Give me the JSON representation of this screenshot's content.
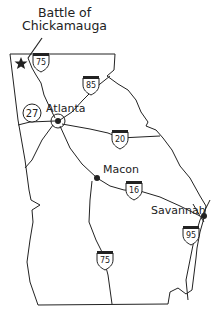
{
  "map": {
    "title_line1": "Battle of",
    "title_line2": "Chickamauga",
    "colors": {
      "ink": "#222222",
      "background": "#ffffff"
    },
    "cities": [
      {
        "name": "Atlanta",
        "x": 57,
        "y": 121
      },
      {
        "name": "Macon",
        "x": 97,
        "y": 178
      },
      {
        "name": "Savannah",
        "x": 204,
        "y": 216
      }
    ],
    "highways": [
      {
        "type": "interstate",
        "number": "75",
        "x": 41,
        "y": 55
      },
      {
        "type": "interstate",
        "number": "85",
        "x": 91,
        "y": 78
      },
      {
        "type": "interstate",
        "number": "20",
        "x": 120,
        "y": 134
      },
      {
        "type": "interstate",
        "number": "16",
        "x": 134,
        "y": 187
      },
      {
        "type": "interstate",
        "number": "95",
        "x": 190,
        "y": 233
      },
      {
        "type": "interstate",
        "number": "75",
        "x": 105,
        "y": 260
      },
      {
        "type": "state",
        "number": "27",
        "x": 32,
        "y": 113
      }
    ],
    "markers": [
      {
        "type": "star",
        "label": "battle-site",
        "x": 21,
        "y": 63
      }
    ]
  }
}
